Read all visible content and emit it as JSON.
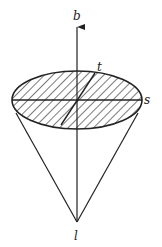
{
  "diagram": {
    "title": "",
    "labels": {
      "b": "b",
      "t": "t",
      "s": "s",
      "l": "l"
    },
    "colors": {
      "stroke": "#222222",
      "background": "#ffffff"
    }
  }
}
